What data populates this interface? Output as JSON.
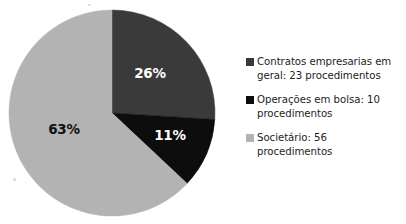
{
  "chart_data": {
    "type": "pie",
    "title": "",
    "categories": [
      "Contratos empresarias em geral",
      "Operações em bolsa",
      "Societário"
    ],
    "values": [
      23,
      10,
      56
    ],
    "percentages": [
      26,
      11,
      63
    ],
    "percent_labels": [
      "26%",
      "11%",
      "63%"
    ],
    "counts_unit": "procedimentos",
    "total": 89,
    "start_angle_deg": 0,
    "direction": "clockwise",
    "colors": [
      "#3a3a3a",
      "#0d0d0d",
      "#b3b3b3"
    ],
    "label_colors": [
      "#ffffff",
      "#ffffff",
      "#111111"
    ],
    "legend_position": "right",
    "grid": false,
    "xlabel": "",
    "ylabel": ""
  },
  "legend": {
    "items": [
      {
        "swatch_color": "#3a3a3a",
        "label": "Contratos empresarias em geral: 23 procedimentos"
      },
      {
        "swatch_color": "#0d0d0d",
        "label": "Operações em bolsa: 10 procedimentos"
      },
      {
        "swatch_color": "#b3b3b3",
        "label": "Societário: 56 procedimentos"
      }
    ]
  },
  "pie_geometry": {
    "cx": 112,
    "cy": 113,
    "r": 103,
    "label_positions": [
      {
        "x": 150,
        "y": 73
      },
      {
        "x": 170,
        "y": 135
      },
      {
        "x": 64,
        "y": 129
      }
    ]
  }
}
